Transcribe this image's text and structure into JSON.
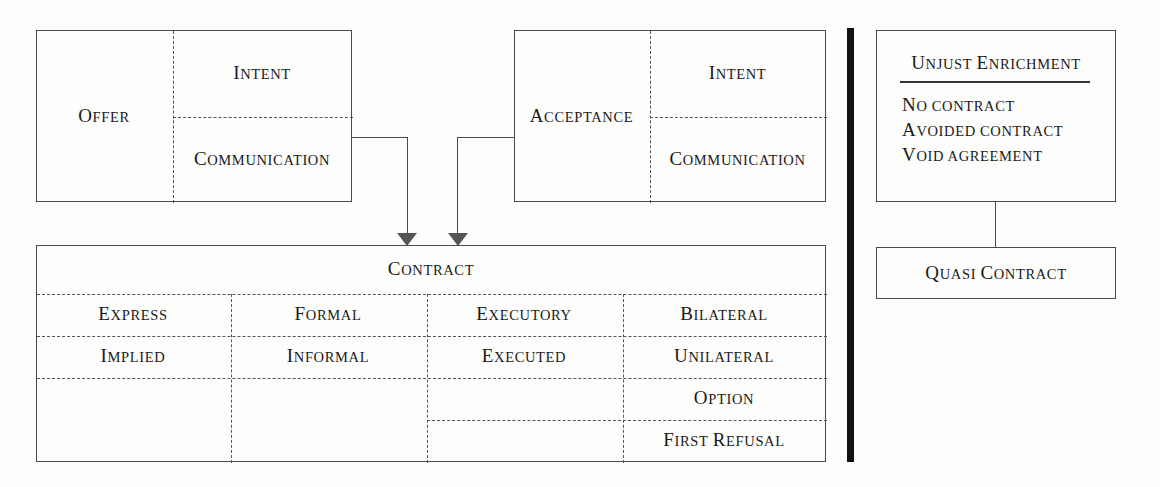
{
  "diagram": {
    "colors": {
      "background": "#fdfdfb",
      "border": "#4a4a4a",
      "dashed": "#555555",
      "divider": "#111111",
      "text": "#1a1a1a"
    }
  },
  "offer_box": {
    "main_label": "Offer",
    "sub_top": "Intent",
    "sub_bottom": "Communication"
  },
  "acceptance_box": {
    "main_label": "Acceptance",
    "sub_top": "Intent",
    "sub_bottom": "Communication"
  },
  "contract_table": {
    "header": "Contract",
    "columns": [
      {
        "name": "formation-column",
        "cells": [
          "Express",
          "Implied"
        ]
      },
      {
        "name": "form-column",
        "cells": [
          "Formal",
          "Informal"
        ]
      },
      {
        "name": "performance-column",
        "cells": [
          "Executory",
          "Executed"
        ]
      },
      {
        "name": "obligation-column",
        "cells": [
          "Bilateral",
          "Unilateral",
          "Option",
          "First Refusal"
        ]
      }
    ]
  },
  "unjust_enrichment_box": {
    "title": "Unjust Enrichment",
    "items": [
      "No contract",
      "Avoided contract",
      "Void agreement"
    ]
  },
  "quasi_contract_box": {
    "label": "Quasi Contract"
  }
}
